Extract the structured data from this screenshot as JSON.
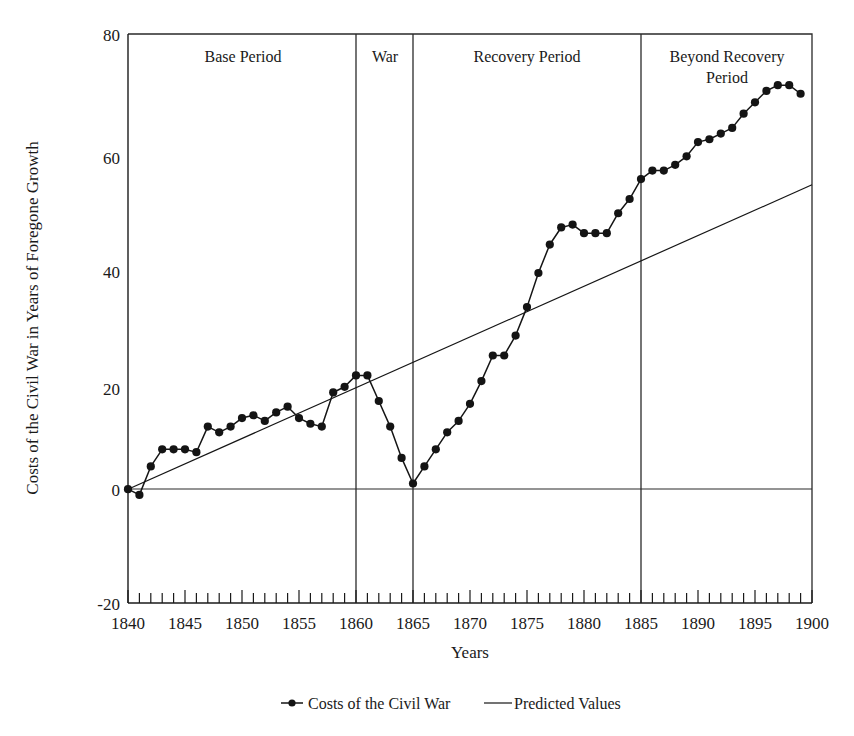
{
  "chart_data": {
    "type": "line",
    "title": "",
    "xlabel": "Years",
    "ylabel": "Costs of the Civil War in Years of Foregone Growth",
    "xlim": [
      1840,
      1900
    ],
    "ylim": [
      -20,
      80
    ],
    "ytick_labels": [
      "80",
      "60",
      "40",
      "20",
      "0",
      "-20"
    ],
    "ytick_values": [
      80,
      60,
      40,
      20,
      0,
      -20
    ],
    "xtick_labels": [
      "1840",
      "1845",
      "1850",
      "1855",
      "1860",
      "1865",
      "1870",
      "1875",
      "1880",
      "1885",
      "1890",
      "1895",
      "1900"
    ],
    "xtick_values": [
      1840,
      1845,
      1850,
      1855,
      1860,
      1865,
      1870,
      1875,
      1880,
      1885,
      1890,
      1895,
      1900
    ],
    "minor_tick_step": 1,
    "grid": false,
    "legend_position": "bottom",
    "legend": [
      {
        "name": "Costs of the Civil War",
        "marker": "filled-circle",
        "line": true
      },
      {
        "name": "Predicted Values",
        "marker": "none",
        "line": true
      }
    ],
    "annotations": [
      {
        "label": "Base Period",
        "x_start": 1840,
        "x_end": 1860
      },
      {
        "label": "War",
        "x_start": 1860,
        "x_end": 1865
      },
      {
        "label": "Recovery Period",
        "x_start": 1865,
        "x_end": 1885
      },
      {
        "label": "Beyond Recovery Period",
        "x_start": 1885,
        "x_end": 1900
      }
    ],
    "divider_years": [
      1860,
      1865,
      1885
    ],
    "series": [
      {
        "name": "Costs of the Civil War",
        "marker": "filled-circle",
        "x": [
          1840,
          1841,
          1842,
          1843,
          1844,
          1845,
          1846,
          1847,
          1848,
          1849,
          1850,
          1851,
          1852,
          1853,
          1854,
          1855,
          1856,
          1857,
          1858,
          1859,
          1860,
          1861,
          1862,
          1863,
          1864,
          1865,
          1866,
          1867,
          1868,
          1869,
          1870,
          1871,
          1872,
          1873,
          1874,
          1875,
          1876,
          1877,
          1878,
          1879,
          1880,
          1881,
          1882,
          1883,
          1884,
          1885,
          1886,
          1887,
          1888,
          1889,
          1890,
          1891,
          1892,
          1893,
          1894,
          1895,
          1896,
          1897,
          1898,
          1899
        ],
        "values": [
          0,
          -1,
          4,
          7,
          7,
          7,
          6.5,
          11,
          10,
          11,
          12.5,
          13,
          12,
          13.5,
          14.5,
          12.5,
          11.5,
          11,
          17,
          18,
          20,
          20,
          15.5,
          11,
          5.5,
          1,
          4,
          7,
          10,
          12,
          15,
          19,
          23.5,
          23.5,
          27,
          32,
          38,
          43,
          46,
          46.5,
          45,
          45,
          45,
          48.5,
          51,
          54.5,
          56,
          56,
          57,
          58.5,
          61,
          61.5,
          62.5,
          63.5,
          66,
          68,
          70,
          71,
          71,
          69.5
        ]
      },
      {
        "name": "Predicted Values",
        "marker": "none",
        "x": [
          1840,
          1900
        ],
        "values": [
          0,
          53.5
        ]
      }
    ]
  },
  "legend": {
    "item1": "Costs of the Civil War",
    "item2": "Predicted Values"
  },
  "axes": {
    "x_title": "Years",
    "y_title": "Costs of the Civil War in Years of Foregone Growth"
  },
  "bands": {
    "base": "Base Period",
    "war": "War",
    "recovery": "Recovery Period",
    "beyond_line1": "Beyond Recovery",
    "beyond_line2": "Period"
  },
  "colors": {
    "ink": "#1a1a1a",
    "series": "#141414",
    "background": "#ffffff"
  }
}
